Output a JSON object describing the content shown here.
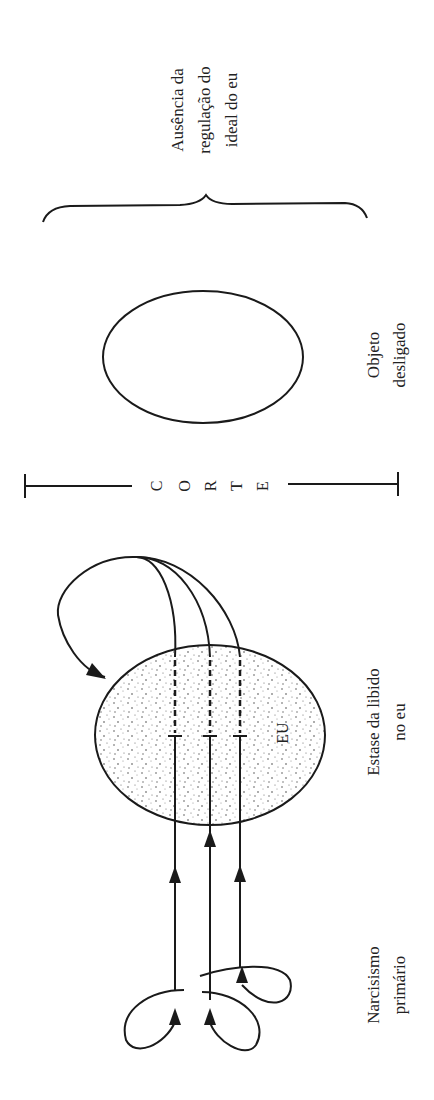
{
  "diagram": {
    "orientation": "rotated-90-ccw",
    "labels": {
      "ideal_absence": [
        "Ausência da",
        "regulação do",
        "ideal do eu"
      ],
      "detached_object": [
        "Objeto",
        "desligado"
      ],
      "cut": [
        "C",
        "O",
        "R",
        "T",
        "E"
      ],
      "ego_stasis": [
        "Estase da libido",
        "no eu"
      ],
      "ego": "EU",
      "primary_narcissism": [
        "Narcisismo",
        "primário"
      ]
    },
    "colors": {
      "stroke": "#1a1a1a",
      "background": "#ffffff",
      "stipple": "#555555"
    }
  }
}
